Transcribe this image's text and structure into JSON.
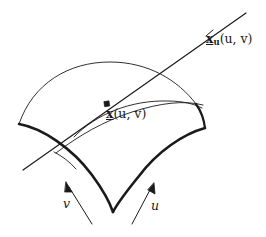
{
  "figure": {
    "kind": "parametric-surface-tangent-vector-diagram",
    "background_color": "#ffffff",
    "ink_color": "#1a1a1a",
    "labels": {
      "tangent_vector": {
        "variable": "x",
        "subscript": "u",
        "arguments": "(u, v)",
        "full_text": "x_u(u, v)"
      },
      "surface_point": {
        "variable": "x",
        "subscript": "",
        "arguments": "(u, v)",
        "full_text": "x(u, v)"
      },
      "param_v": "v",
      "param_u": "u"
    },
    "annotations": {
      "point_marker": "filled-dot",
      "tangent_line": "straight-line-through-point",
      "tick_marker": "open-tick-on-tangent-line",
      "arrow_v_direction": "up-left",
      "arrow_u_direction": "up-right"
    }
  }
}
